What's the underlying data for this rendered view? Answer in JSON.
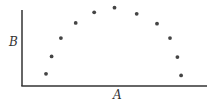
{
  "chart_data": {
    "type": "scatter",
    "title": "",
    "xlabel": "A",
    "ylabel": "B",
    "grid": false,
    "legend": null,
    "xlim": [
      0,
      100
    ],
    "ylim": [
      0,
      100
    ],
    "x_ticks": [],
    "y_ticks": [],
    "series": [
      {
        "name": "points",
        "x": [
          13,
          16,
          21,
          29,
          39,
          50,
          62,
          73,
          80,
          84,
          86
        ],
        "y": [
          16,
          39,
          63,
          83,
          97,
          103,
          95,
          82,
          63,
          38,
          14
        ]
      }
    ],
    "colors": {
      "axis": "#333333",
      "point": "#444444",
      "background": "#ffffff"
    }
  }
}
